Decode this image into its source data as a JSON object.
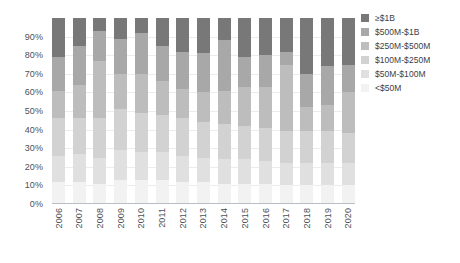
{
  "chart_data": {
    "type": "bar",
    "subtype": "stacked-percentage-column",
    "title": "",
    "xlabel": "",
    "ylabel": "",
    "ylim": [
      0,
      100
    ],
    "grid": true,
    "legend_position": "right",
    "categories": [
      "2006",
      "2007",
      "2008",
      "2009",
      "2010",
      "2011",
      "2012",
      "2013",
      "2014",
      "2015",
      "2016",
      "2017",
      "2018",
      "2019",
      "2020"
    ],
    "ytick_labels": [
      "0%",
      "10%",
      "20%",
      "30%",
      "40%",
      "50%",
      "60%",
      "70%",
      "80%",
      "90%"
    ],
    "ytick_values": [
      0,
      10,
      20,
      30,
      40,
      50,
      60,
      70,
      80,
      90
    ],
    "series": [
      {
        "name": "<$50M",
        "color": "#f2f2f2",
        "values": [
          12,
          12,
          11,
          13,
          13,
          13,
          12,
          12,
          11,
          11,
          11,
          10,
          10,
          10,
          10
        ]
      },
      {
        "name": "$50M-$100M",
        "color": "#e0e0e0",
        "values": [
          14,
          15,
          14,
          16,
          15,
          15,
          14,
          13,
          13,
          13,
          12,
          12,
          12,
          12,
          12
        ]
      },
      {
        "name": "$100M-$250M",
        "color": "#d2d2d2",
        "values": [
          20,
          19,
          21,
          22,
          21,
          20,
          20,
          19,
          19,
          18,
          18,
          17,
          17,
          17,
          16
        ]
      },
      {
        "name": "$250M-$500M",
        "color": "#bdbdbd",
        "values": [
          15,
          18,
          31,
          19,
          21,
          18,
          16,
          16,
          18,
          21,
          22,
          36,
          13,
          14,
          22
        ]
      },
      {
        "name": "$500M-$1B",
        "color": "#a8a8a8",
        "values": [
          18,
          21,
          16,
          19,
          22,
          19,
          20,
          21,
          27,
          16,
          17,
          7,
          18,
          21,
          15
        ]
      },
      {
        "name": "≥$1B",
        "color": "#787878",
        "values": [
          21,
          15,
          7,
          11,
          8,
          15,
          18,
          19,
          12,
          21,
          20,
          18,
          30,
          26,
          25
        ]
      }
    ]
  },
  "legend": {
    "items": [
      {
        "label": "≥$1B",
        "color": "#787878"
      },
      {
        "label": "$500M-$1B",
        "color": "#a8a8a8"
      },
      {
        "label": "$250M-$500M",
        "color": "#bdbdbd"
      },
      {
        "label": "$100M-$250M",
        "color": "#d2d2d2"
      },
      {
        "label": "$50M-$100M",
        "color": "#e0e0e0"
      },
      {
        "label": "<$50M",
        "color": "#f2f2f2"
      }
    ]
  }
}
